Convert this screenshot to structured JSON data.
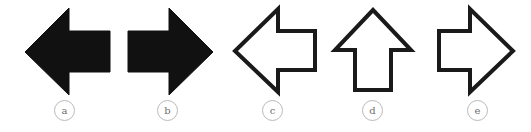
{
  "page": {
    "width": 531,
    "height": 132,
    "background_color": "#ffffff"
  },
  "style": {
    "solid_fill_color": "#111111",
    "outline_stroke_color": "#1a1a1a",
    "outline_fill_color": "#ffffff",
    "outline_stroke_width": 4,
    "label_circle_border_color": "#b9b9b9",
    "label_text_color": "#6e6e6e"
  },
  "figure": {
    "items": [
      {
        "id": "a",
        "label": "a",
        "icon_name": "arrow-left-solid-icon",
        "direction": "left",
        "style": "solid",
        "fill": "#111111"
      },
      {
        "id": "b",
        "label": "b",
        "icon_name": "arrow-right-solid-icon",
        "direction": "right",
        "style": "solid",
        "fill": "#111111"
      },
      {
        "id": "c",
        "label": "c",
        "icon_name": "arrow-left-outline-icon",
        "direction": "left",
        "style": "outline",
        "fill": "#ffffff"
      },
      {
        "id": "d",
        "label": "d",
        "icon_name": "arrow-up-outline-icon",
        "direction": "up",
        "style": "outline",
        "fill": "#ffffff"
      },
      {
        "id": "e",
        "label": "e",
        "icon_name": "arrow-right-outline-icon",
        "direction": "right",
        "style": "outline",
        "fill": "#ffffff"
      }
    ]
  }
}
